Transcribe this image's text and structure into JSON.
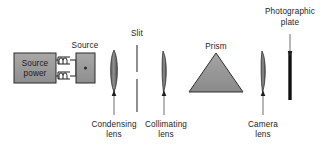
{
  "figure": {
    "background_color": "#ffffff",
    "ink_color": "#1c1c1c",
    "component_fill": "#999999",
    "plate_color": "#111111"
  },
  "labels": {
    "source_power_line1": "Source",
    "source_power_line2": "power",
    "source": "Source",
    "slit": "Slit",
    "condensing_line1": "Condensing",
    "condensing_line2": "lens",
    "collimating_line1": "Collimating",
    "collimating_line2": "lens",
    "prism": "Prism",
    "camera_line1": "Camera",
    "camera_line2": "lens",
    "plate_line1": "Photographic",
    "plate_line2": "plate"
  },
  "components": [
    {
      "id": "source-power-supply",
      "label": "Source power",
      "kind": "box"
    },
    {
      "id": "transformer-coils",
      "label": "coils",
      "kind": "coil"
    },
    {
      "id": "light-source",
      "label": "Source",
      "kind": "box"
    },
    {
      "id": "condensing-lens",
      "label": "Condensing lens",
      "kind": "lens"
    },
    {
      "id": "slit",
      "label": "Slit",
      "kind": "slit"
    },
    {
      "id": "collimating-lens",
      "label": "Collimating lens",
      "kind": "lens"
    },
    {
      "id": "prism",
      "label": "Prism",
      "kind": "triangle"
    },
    {
      "id": "camera-lens",
      "label": "Camera lens",
      "kind": "lens"
    },
    {
      "id": "photographic-plate",
      "label": "Photographic plate",
      "kind": "bar"
    }
  ]
}
